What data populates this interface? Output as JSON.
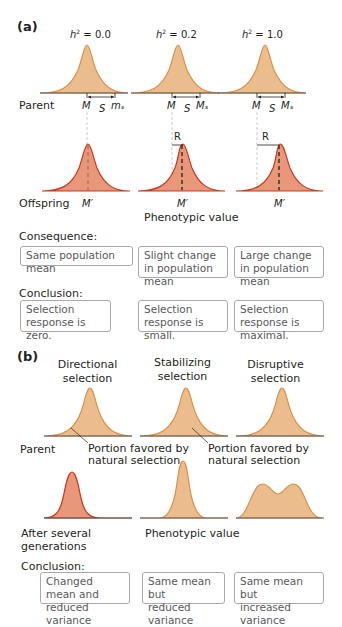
{
  "panel_a": {
    "label": "(a)",
    "columns": [
      {
        "heritability_label": "h² = 0.0",
        "h_sym": "h",
        "h_val": "= 0.0",
        "parent_labels": [
          "M",
          "S",
          "mₛ"
        ],
        "offspring_label": "M′",
        "response_label": ""
      },
      {
        "heritability_label": "h² = 0.2",
        "h_sym": "h",
        "h_val": "= 0.2",
        "parent_labels": [
          "M",
          "S",
          "Mₛ"
        ],
        "offspring_label": "M′",
        "response_label": "R"
      },
      {
        "heritability_label": "h² = 1.0",
        "h_sym": "h",
        "h_val": "= 1.0",
        "parent_labels": [
          "M",
          "S",
          "Mₛ"
        ],
        "offspring_label": "M′",
        "response_label": "R"
      }
    ],
    "row_parent": "Parent",
    "row_offspring": "Offspring",
    "x_axis_label": "Phenotypic value",
    "consequence_heading": "Consequence:",
    "consequences": [
      "Same population mean",
      "Slight change in population mean",
      "Large change in population mean"
    ],
    "conclusion_heading": "Conclusion:",
    "conclusions": [
      "Selection response is zero.",
      "Selection response is small.",
      "Selection response is maximal."
    ]
  },
  "panel_b": {
    "label": "(b)",
    "column_titles": [
      {
        "line1": "Directional",
        "line2": "selection"
      },
      {
        "line1": "Stabilizing",
        "line2": "selection"
      },
      {
        "line1": "Disruptive",
        "line2": "selection"
      }
    ],
    "row_parent": "Parent",
    "annotation_1": {
      "line1": "Portion favored by",
      "line2": "natural selection"
    },
    "annotation_2": {
      "line1": "Portion favored by",
      "line2": "natural selection"
    },
    "row_after_1": "After several",
    "row_after_2": "generations",
    "x_axis_label": "Phenotypic value",
    "conclusion_heading": "Conclusion:",
    "conclusions": [
      {
        "line1": "Changed mean and",
        "line2": "reduced variance"
      },
      {
        "line1": "Same mean but",
        "line2": "reduced variance"
      },
      {
        "line1": "Same mean but",
        "line2": "increased variance"
      }
    ]
  },
  "colors": {
    "parent_fill": "#ecbd8c",
    "parent_stroke": "#d9904a",
    "offspring_fill": "#e8977a",
    "offspring_stroke": "#c8381e",
    "axis": "#58595b",
    "box_border": "#a7a9ac"
  }
}
